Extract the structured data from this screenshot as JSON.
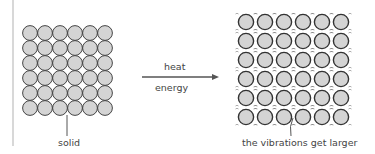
{
  "diagram": {
    "left_label": "solid",
    "arrow_label_top": "heat",
    "arrow_label_bottom": "energy",
    "right_label": "the vibrations get larger",
    "grid_rows": 6,
    "grid_cols": 6,
    "colors": {
      "particle_fill": "#d4d4d4",
      "particle_stroke": "#333333",
      "arrow": "#555555",
      "divider": "#d8d8d8"
    }
  }
}
